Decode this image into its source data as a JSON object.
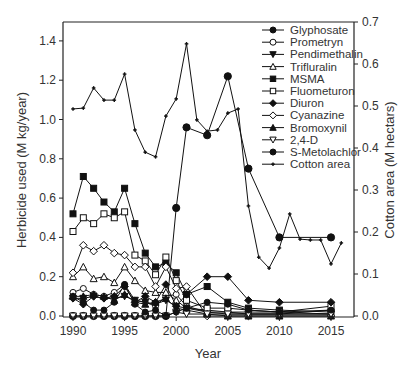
{
  "chart_data": {
    "type": "line",
    "title": "",
    "xlabel": "Year",
    "ylabel": "Herbicide used (M kg/year)",
    "y2label": "Cotton area (M hectars)",
    "xlim": [
      1989,
      2017
    ],
    "ylim": [
      0,
      1.5
    ],
    "y2lim": [
      0,
      0.7
    ],
    "xticks": [
      1990,
      1995,
      2000,
      2005,
      2010,
      2015
    ],
    "yticks": [
      0.0,
      0.2,
      0.4,
      0.6,
      0.8,
      1.0,
      1.2,
      1.4
    ],
    "ytick_labels": [
      "0.0",
      "0.2",
      "0.4",
      "0.6",
      "0.8",
      "1.0",
      "1.2",
      "1.4"
    ],
    "y2ticks": [
      0.0,
      0.1,
      0.2,
      0.3,
      0.4,
      0.5,
      0.6,
      0.7
    ],
    "y2tick_labels": [
      "0.0",
      "0.1",
      "0.2",
      "0.3",
      "0.4",
      "0.5",
      "0.6",
      "0.7"
    ],
    "grid": false,
    "legend_position": "upper right (inside)",
    "series": [
      {
        "name": "Glyphosate",
        "marker": "circle-filled",
        "axis": "left",
        "x": [
          1990,
          1991,
          1992,
          1993,
          1994,
          1995,
          1996,
          1997,
          1998,
          1999,
          2000,
          2001,
          2003,
          2005,
          2007,
          2010,
          2015
        ],
        "values": [
          0.0,
          0.0,
          0.0,
          0.0,
          0.0,
          0.0,
          0.0,
          0.0,
          0.0,
          0.0,
          0.55,
          0.96,
          0.92,
          1.22,
          0.75,
          0.4,
          0.4
        ]
      },
      {
        "name": "Prometryn",
        "marker": "circle-open",
        "axis": "left",
        "x": [
          1990,
          1991,
          1992,
          1993,
          1994,
          1995,
          1996,
          1997,
          1998,
          1999,
          2000,
          2001,
          2003,
          2005,
          2007,
          2010,
          2015
        ],
        "values": [
          0.12,
          0.14,
          0.11,
          0.1,
          0.12,
          0.16,
          0.08,
          0.07,
          0.05,
          0.1,
          0.11,
          0.05,
          0.02,
          0.02,
          0.01,
          0.01,
          0.03
        ]
      },
      {
        "name": "Pendimethalin",
        "marker": "triangle-down-filled",
        "axis": "left",
        "x": [
          1990,
          1991,
          1992,
          1993,
          1994,
          1995,
          1996,
          1997,
          1998,
          1999,
          2000,
          2001,
          2003,
          2005,
          2007,
          2010,
          2015
        ],
        "values": [
          0.09,
          0.09,
          0.1,
          0.09,
          0.09,
          0.1,
          0.08,
          0.07,
          0.06,
          0.08,
          0.05,
          0.04,
          0.03,
          0.02,
          0.02,
          0.02,
          0.01
        ]
      },
      {
        "name": "Trifluralin",
        "marker": "triangle-up-open",
        "axis": "left",
        "x": [
          1990,
          1991,
          1992,
          1993,
          1994,
          1995,
          1996,
          1997,
          1998,
          1999,
          2000,
          2001,
          2003,
          2005,
          2007,
          2010,
          2015
        ],
        "values": [
          0.2,
          0.25,
          0.19,
          0.2,
          0.17,
          0.25,
          0.18,
          0.13,
          0.12,
          0.12,
          0.08,
          0.04,
          0.02,
          0.01,
          0.01,
          0.01,
          0.01
        ]
      },
      {
        "name": "MSMA",
        "marker": "square-filled",
        "axis": "left",
        "x": [
          1990,
          1991,
          1992,
          1993,
          1994,
          1995,
          1996,
          1997,
          1998,
          1999,
          2000,
          2001,
          2003,
          2005,
          2007,
          2010,
          2015
        ],
        "values": [
          0.52,
          0.71,
          0.65,
          0.58,
          0.53,
          0.65,
          0.47,
          0.32,
          0.25,
          0.27,
          0.22,
          0.11,
          0.15,
          0.07,
          0.04,
          0.03,
          0.02
        ]
      },
      {
        "name": "Fluometuron",
        "marker": "square-open",
        "axis": "left",
        "x": [
          1990,
          1991,
          1992,
          1993,
          1994,
          1995,
          1996,
          1997,
          1998,
          1999,
          2000,
          2001,
          2003,
          2005,
          2007,
          2010,
          2015
        ],
        "values": [
          0.43,
          0.5,
          0.47,
          0.52,
          0.5,
          0.53,
          0.31,
          0.28,
          0.21,
          0.3,
          0.18,
          0.08,
          0.04,
          0.04,
          0.03,
          0.02,
          0.05
        ]
      },
      {
        "name": "Diuron",
        "marker": "diamond-filled",
        "axis": "left",
        "x": [
          1990,
          1991,
          1992,
          1993,
          1994,
          1995,
          1996,
          1997,
          1998,
          1999,
          2000,
          2001,
          2003,
          2005,
          2007,
          2010,
          2015
        ],
        "values": [
          0.09,
          0.06,
          0.1,
          0.09,
          0.1,
          0.15,
          0.07,
          0.1,
          0.07,
          0.16,
          0.05,
          0.11,
          0.2,
          0.2,
          0.08,
          0.07,
          0.07
        ]
      },
      {
        "name": "Cyanazine",
        "marker": "diamond-open",
        "axis": "left",
        "x": [
          1990,
          1991,
          1992,
          1993,
          1994,
          1995,
          1996,
          1997,
          1998,
          1999,
          2000,
          2001,
          2003,
          2005,
          2007,
          2010,
          2015
        ],
        "values": [
          0.22,
          0.36,
          0.33,
          0.36,
          0.32,
          0.31,
          0.25,
          0.25,
          0.15,
          0.25,
          0.14,
          0.15,
          0.0,
          0.0,
          0.0,
          0.0,
          0.0
        ]
      },
      {
        "name": "Bromoxynil",
        "marker": "triangle-up-filled",
        "axis": "left",
        "x": [
          1990,
          1991,
          1992,
          1993,
          1994,
          1995,
          1996,
          1997,
          1998,
          1999,
          2000,
          2001,
          2003,
          2005,
          2007,
          2010,
          2015
        ],
        "values": [
          0.1,
          0.1,
          0.11,
          0.1,
          0.08,
          0.11,
          0.07,
          0.06,
          0.07,
          0.09,
          0.04,
          0.03,
          0.01,
          0.0,
          0.0,
          0.0,
          0.0
        ]
      },
      {
        "name": "2,4-D",
        "marker": "triangle-down-open",
        "axis": "left",
        "x": [
          1990,
          1991,
          1992,
          1993,
          1994,
          1995,
          1996,
          1997,
          1998,
          1999,
          2000,
          2001,
          2003,
          2005,
          2007,
          2010,
          2015
        ],
        "values": [
          0.0,
          0.0,
          0.0,
          0.0,
          0.0,
          0.0,
          0.0,
          0.0,
          0.0,
          0.0,
          0.02,
          0.01,
          0.01,
          0.01,
          0.01,
          0.01,
          0.01
        ]
      },
      {
        "name": "S-Metolachlor",
        "marker": "circle-filled",
        "axis": "left",
        "x": [
          1990,
          1991,
          1992,
          1993,
          1994,
          1995,
          1996,
          1997,
          1998,
          1999,
          2000,
          2001,
          2003,
          2005,
          2007,
          2010,
          2015
        ],
        "values": [
          0.1,
          0.07,
          0.03,
          0.03,
          0.07,
          0.16,
          0.06,
          0.02,
          0.03,
          0.0,
          0.02,
          0.04,
          0.07,
          0.06,
          0.03,
          0.02,
          0.03
        ]
      },
      {
        "name": "Cotton area",
        "marker": "plus-small",
        "axis": "right",
        "x": [
          1990,
          1991,
          1992,
          1993,
          1994,
          1995,
          1996,
          1997,
          1998,
          1999,
          2000,
          2001,
          2002,
          2003,
          2004,
          2005,
          2006,
          2007,
          2008,
          2009,
          2010,
          2011,
          2012,
          2013,
          2014,
          2015,
          2016
        ],
        "values": [
          0.493,
          0.495,
          0.543,
          0.514,
          0.514,
          0.576,
          0.443,
          0.39,
          0.379,
          0.476,
          0.517,
          0.648,
          0.467,
          0.44,
          0.443,
          0.483,
          0.493,
          0.262,
          0.14,
          0.114,
          0.162,
          0.243,
          0.183,
          0.181,
          0.181,
          0.124,
          0.174
        ]
      }
    ]
  },
  "plot_area": {
    "left": 63,
    "top": 22,
    "right": 354,
    "bottom": 317
  },
  "colors": {
    "line": "#111111",
    "axis": "#222222",
    "text": "#333333",
    "background": "#ffffff"
  }
}
